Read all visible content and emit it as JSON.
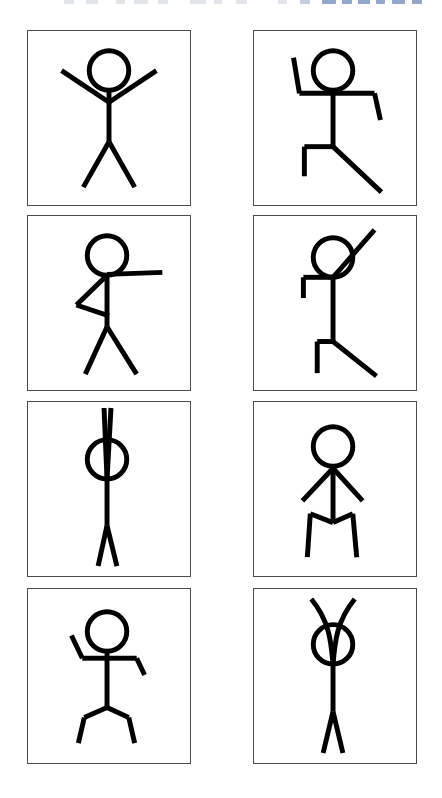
{
  "page": {
    "background_color": "#ffffff",
    "width": 442,
    "height": 798
  },
  "chrome_strip": {
    "description": "cut-off toolbar text row at top edge",
    "fragments": [
      {
        "x": 64,
        "w": 10,
        "color": "#c9ced6"
      },
      {
        "x": 86,
        "w": 12,
        "color": "#c9ced6"
      },
      {
        "x": 116,
        "w": 9,
        "color": "#c9ced6"
      },
      {
        "x": 134,
        "w": 14,
        "color": "#c9ced6"
      },
      {
        "x": 158,
        "w": 10,
        "color": "#c9ced6"
      },
      {
        "x": 190,
        "w": 16,
        "color": "#c9ced6"
      },
      {
        "x": 214,
        "w": 8,
        "color": "#c9ced6"
      },
      {
        "x": 236,
        "w": 11,
        "color": "#c9ced6"
      },
      {
        "x": 278,
        "w": 9,
        "color": "#c9ced6"
      },
      {
        "x": 300,
        "w": 10,
        "color": "#8fa6c4"
      },
      {
        "x": 322,
        "w": 14,
        "color": "#3b5f9e"
      },
      {
        "x": 342,
        "w": 10,
        "color": "#3b5f9e"
      },
      {
        "x": 358,
        "w": 12,
        "color": "#3b5f9e"
      },
      {
        "x": 376,
        "w": 9,
        "color": "#3b5f9e"
      },
      {
        "x": 392,
        "w": 13,
        "color": "#3b5f9e"
      },
      {
        "x": 412,
        "w": 10,
        "color": "#3b5f9e"
      }
    ]
  },
  "grid": {
    "columns": 2,
    "rows": 4,
    "panel_width": 164,
    "panel_height": 176,
    "border_color": "#4c4c4c",
    "stroke_color": "#000000",
    "panels": [
      {
        "id": "pose-1",
        "caption": "arms up in V, legs apart",
        "row": 1,
        "col": 1,
        "x": 27,
        "y": 30,
        "stroke_width": 5,
        "head": {
          "cx": 82,
          "cy": 40,
          "r": 20,
          "stroke_width": 5
        },
        "lines": [
          {
            "name": "spine",
            "x1": 82,
            "y1": 60,
            "x2": 82,
            "y2": 112
          },
          {
            "name": "arm-left",
            "x1": 82,
            "y1": 72,
            "x2": 34,
            "y2": 40
          },
          {
            "name": "arm-right",
            "x1": 82,
            "y1": 72,
            "x2": 130,
            "y2": 40
          },
          {
            "name": "leg-left",
            "x1": 82,
            "y1": 112,
            "x2": 56,
            "y2": 158
          },
          {
            "name": "leg-right",
            "x1": 82,
            "y1": 112,
            "x2": 108,
            "y2": 158
          }
        ]
      },
      {
        "id": "pose-2",
        "caption": "running: left arm up-bent, right arm down-bent, left leg forward-bent, right leg extended back",
        "row": 1,
        "col": 2,
        "x": 253,
        "y": 30,
        "stroke_width": 5,
        "head": {
          "cx": 80,
          "cy": 40,
          "r": 20,
          "stroke_width": 5
        },
        "lines": [
          {
            "name": "spine",
            "x1": 80,
            "y1": 60,
            "x2": 80,
            "y2": 117
          },
          {
            "name": "arm-left-upper",
            "x1": 80,
            "y1": 63,
            "x2": 46,
            "y2": 63
          },
          {
            "name": "arm-left-fore",
            "x1": 46,
            "y1": 63,
            "x2": 40,
            "y2": 27
          },
          {
            "name": "arm-right-upper",
            "x1": 80,
            "y1": 63,
            "x2": 122,
            "y2": 63
          },
          {
            "name": "arm-right-fore",
            "x1": 122,
            "y1": 63,
            "x2": 128,
            "y2": 90
          },
          {
            "name": "leg-left-upper",
            "x1": 80,
            "y1": 117,
            "x2": 51,
            "y2": 117
          },
          {
            "name": "leg-left-lower",
            "x1": 51,
            "y1": 117,
            "x2": 51,
            "y2": 147
          },
          {
            "name": "leg-right",
            "x1": 80,
            "y1": 117,
            "x2": 129,
            "y2": 163
          }
        ]
      },
      {
        "id": "pose-3",
        "caption": "right arm straight out, left arm bent into triangle at hip, legs apart",
        "row": 2,
        "col": 1,
        "x": 27,
        "y": 215,
        "stroke_width": 5,
        "head": {
          "cx": 80,
          "cy": 40,
          "r": 20,
          "stroke_width": 5
        },
        "lines": [
          {
            "name": "spine",
            "x1": 80,
            "y1": 60,
            "x2": 80,
            "y2": 112
          },
          {
            "name": "arm-right",
            "x1": 80,
            "y1": 59,
            "x2": 136,
            "y2": 57
          },
          {
            "name": "arm-left-upper",
            "x1": 80,
            "y1": 60,
            "x2": 49,
            "y2": 90
          },
          {
            "name": "arm-left-fore",
            "x1": 49,
            "y1": 90,
            "x2": 82,
            "y2": 101
          },
          {
            "name": "leg-left",
            "x1": 80,
            "y1": 112,
            "x2": 58,
            "y2": 160
          },
          {
            "name": "leg-right",
            "x1": 80,
            "y1": 112,
            "x2": 110,
            "y2": 160
          }
        ]
      },
      {
        "id": "pose-4",
        "caption": "right arm raised diagonally, left arm bent down, left leg bent down, right leg extended diagonally",
        "row": 2,
        "col": 2,
        "x": 253,
        "y": 215,
        "stroke_width": 5,
        "head": {
          "cx": 80,
          "cy": 42,
          "r": 20,
          "stroke_width": 5
        },
        "lines": [
          {
            "name": "spine",
            "x1": 80,
            "y1": 62,
            "x2": 80,
            "y2": 127
          },
          {
            "name": "arm-right",
            "x1": 80,
            "y1": 62,
            "x2": 122,
            "y2": 14
          },
          {
            "name": "arm-left-upper",
            "x1": 80,
            "y1": 62,
            "x2": 50,
            "y2": 62
          },
          {
            "name": "arm-left-fore",
            "x1": 50,
            "y1": 62,
            "x2": 50,
            "y2": 83
          },
          {
            "name": "leg-left-upper",
            "x1": 80,
            "y1": 127,
            "x2": 64,
            "y2": 127
          },
          {
            "name": "leg-left-lower",
            "x1": 64,
            "y1": 127,
            "x2": 64,
            "y2": 159
          },
          {
            "name": "leg-right",
            "x1": 80,
            "y1": 127,
            "x2": 124,
            "y2": 162
          }
        ]
      },
      {
        "id": "pose-5",
        "caption": "both arms straight up meeting above head in teardrop, legs together",
        "row": 3,
        "col": 1,
        "x": 27,
        "y": 401,
        "stroke_width": 5,
        "head": {
          "cx": 80,
          "cy": 58,
          "r": 20,
          "stroke_width": 5
        },
        "lines": [
          {
            "name": "spine",
            "x1": 80,
            "y1": 78,
            "x2": 80,
            "y2": 125
          },
          {
            "name": "arm-left",
            "x1": 80,
            "y1": 78,
            "x2": 77,
            "y2": 6
          },
          {
            "name": "arm-right",
            "x1": 80,
            "y1": 78,
            "x2": 84,
            "y2": 6
          },
          {
            "name": "leg-left",
            "x1": 80,
            "y1": 125,
            "x2": 71,
            "y2": 166
          },
          {
            "name": "leg-right",
            "x1": 80,
            "y1": 125,
            "x2": 90,
            "y2": 166
          }
        ]
      },
      {
        "id": "pose-6",
        "caption": "arms angled down and out, legs bent forming M shape",
        "row": 3,
        "col": 2,
        "x": 253,
        "y": 401,
        "stroke_width": 5,
        "head": {
          "cx": 80,
          "cy": 45,
          "r": 20,
          "stroke_width": 5
        },
        "lines": [
          {
            "name": "spine",
            "x1": 80,
            "y1": 65,
            "x2": 80,
            "y2": 122
          },
          {
            "name": "arm-left",
            "x1": 80,
            "y1": 67,
            "x2": 49,
            "y2": 100
          },
          {
            "name": "arm-right",
            "x1": 80,
            "y1": 67,
            "x2": 110,
            "y2": 100
          },
          {
            "name": "leg-left-upper",
            "x1": 80,
            "y1": 122,
            "x2": 57,
            "y2": 113
          },
          {
            "name": "leg-left-lower",
            "x1": 57,
            "y1": 113,
            "x2": 54,
            "y2": 157
          },
          {
            "name": "leg-right-upper",
            "x1": 80,
            "y1": 122,
            "x2": 100,
            "y2": 113
          },
          {
            "name": "leg-right-lower",
            "x1": 100,
            "y1": 113,
            "x2": 104,
            "y2": 157
          }
        ]
      },
      {
        "id": "pose-7",
        "caption": "left arm bent up, right arm bent down, legs apart and slightly bent",
        "row": 4,
        "col": 1,
        "x": 27,
        "y": 588,
        "stroke_width": 5,
        "head": {
          "cx": 80,
          "cy": 43,
          "r": 20,
          "stroke_width": 5
        },
        "lines": [
          {
            "name": "spine",
            "x1": 80,
            "y1": 63,
            "x2": 80,
            "y2": 120
          },
          {
            "name": "arm-left-upper",
            "x1": 80,
            "y1": 70,
            "x2": 55,
            "y2": 70
          },
          {
            "name": "arm-left-fore",
            "x1": 55,
            "y1": 70,
            "x2": 44,
            "y2": 47
          },
          {
            "name": "arm-right-upper",
            "x1": 80,
            "y1": 70,
            "x2": 110,
            "y2": 70
          },
          {
            "name": "arm-right-fore",
            "x1": 110,
            "y1": 70,
            "x2": 118,
            "y2": 87
          },
          {
            "name": "leg-left-upper",
            "x1": 80,
            "y1": 120,
            "x2": 57,
            "y2": 130
          },
          {
            "name": "leg-left-lower",
            "x1": 57,
            "y1": 130,
            "x2": 51,
            "y2": 156
          },
          {
            "name": "leg-right-upper",
            "x1": 80,
            "y1": 120,
            "x2": 102,
            "y2": 130
          },
          {
            "name": "leg-right-lower",
            "x1": 102,
            "y1": 130,
            "x2": 108,
            "y2": 156
          }
        ]
      },
      {
        "id": "pose-8",
        "caption": "arms raised crossing in X above head, legs together",
        "row": 4,
        "col": 2,
        "x": 253,
        "y": 588,
        "stroke_width": 5,
        "head": {
          "cx": 80,
          "cy": 56,
          "r": 20,
          "stroke_width": 5
        },
        "lines": [
          {
            "name": "spine",
            "x1": 80,
            "y1": 76,
            "x2": 80,
            "y2": 124
          },
          {
            "name": "leg-left",
            "x1": 80,
            "y1": 124,
            "x2": 70,
            "y2": 166
          },
          {
            "name": "leg-right",
            "x1": 80,
            "y1": 124,
            "x2": 90,
            "y2": 166
          }
        ],
        "curves": [
          {
            "name": "arm-left-crossed",
            "d": "M 80 76 C 78 52 76 32 58 10"
          },
          {
            "name": "arm-right-crossed",
            "d": "M 80 76 C 82 52 84 32 102 10"
          }
        ]
      }
    ]
  }
}
